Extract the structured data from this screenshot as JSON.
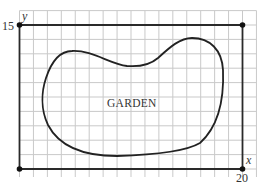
{
  "figure": {
    "type": "coordinate-grid-diagram",
    "region_label": "GARDEN",
    "axes": {
      "x": {
        "label": "x",
        "min": 0,
        "max": 20,
        "tick_labels": [
          "20"
        ]
      },
      "y": {
        "label": "y",
        "min": 0,
        "max": 15,
        "tick_labels": [
          "15"
        ]
      }
    },
    "grid": {
      "columns_between_axes": 16,
      "rows_between_axes": 10,
      "x_units_per_cell": 1.25,
      "y_units_per_cell": 1.5
    },
    "marked_points": [
      {
        "x": 0,
        "y": 15
      },
      {
        "x": 20,
        "y": 15
      },
      {
        "x": 0,
        "y": 0
      },
      {
        "x": 20,
        "y": 0
      }
    ],
    "colors": {
      "grid": "#c9c9c9",
      "frame": "#2a2a2a",
      "curve": "#222222",
      "text": "#333333",
      "background": "#ffffff"
    }
  }
}
